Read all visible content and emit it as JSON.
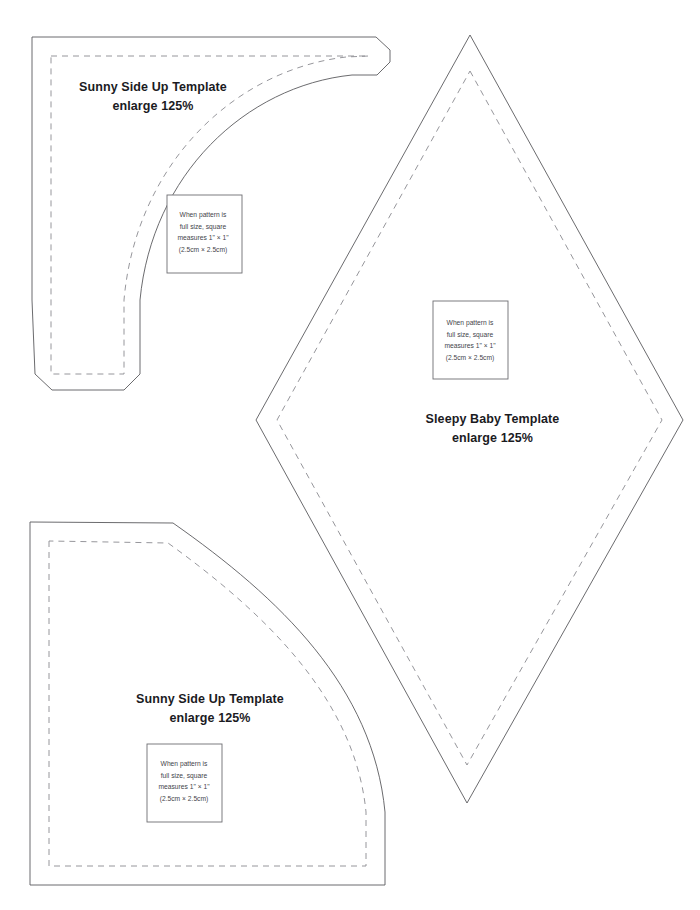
{
  "page": {
    "kind": "printable-pattern-sheet",
    "background_color": "#ffffff",
    "cut_line_color": "#5a5a5e",
    "seam_line_color": "#8a8a90",
    "title_color": "#1b1b1f",
    "note_color": "#44444a"
  },
  "shared": {
    "scale_note": {
      "line1": "When pattern is",
      "line2": "full size, square",
      "line3": "measures 1\" × 1\"",
      "line4": "(2.5cm × 2.5cm)"
    },
    "enlarge_label": "enlarge 125%"
  },
  "templates": [
    {
      "id": "sunny-side-up-top",
      "name": "Sunny Side Up Template",
      "enlarge": "enlarge 125%",
      "shape": "quarter-arc-crescent",
      "note": {
        "line1": "When pattern is",
        "line2": "full size, square",
        "line3": "measures 1\" × 1\"",
        "line4": "(2.5cm × 2.5cm)"
      }
    },
    {
      "id": "sleepy-baby",
      "name": "Sleepy Baby Template",
      "enlarge": "enlarge 125%",
      "shape": "diamond",
      "note": {
        "line1": "When pattern is",
        "line2": "full size, square",
        "line3": "measures 1\" × 1\"",
        "line4": "(2.5cm × 2.5cm)"
      }
    },
    {
      "id": "sunny-side-up-bottom",
      "name": "Sunny Side Up Template",
      "enlarge": "enlarge 125%",
      "shape": "quarter-circle-wedge",
      "note": {
        "line1": "When pattern is",
        "line2": "full size, square",
        "line3": "measures 1\" × 1\"",
        "line4": "(2.5cm × 2.5cm)"
      }
    }
  ]
}
